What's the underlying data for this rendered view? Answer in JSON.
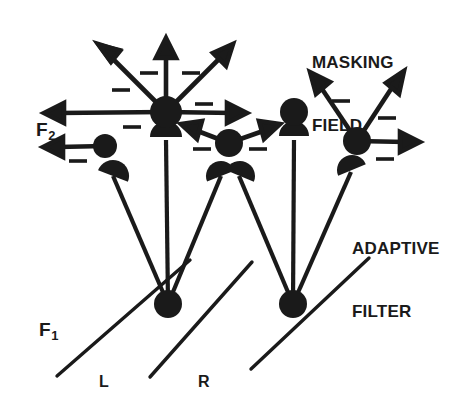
{
  "figure": {
    "background_color": "#ffffff",
    "ink_color": "#1a1a1a",
    "width": 458,
    "height": 410
  },
  "annotations": {
    "masking_field_line1": "MASKING",
    "masking_field_line2": "FIELD",
    "adaptive_filter_line1": "ADAPTIVE",
    "adaptive_filter_line2": "FILTER"
  },
  "layer_labels": {
    "f2_base": "F",
    "f2_sub": "2",
    "f1_base": "F",
    "f1_sub": "1"
  },
  "item_labels": {
    "left": "L",
    "right": "R"
  },
  "diagram_data": {
    "type": "node-link-diagram",
    "f1_nodes": [
      {
        "id": "f1-L",
        "cx": 168,
        "cy": 304,
        "r": 13
      },
      {
        "id": "f1-R",
        "cx": 293,
        "cy": 304,
        "r": 13
      }
    ],
    "f2_nodes": [
      {
        "id": "f2-a",
        "cx": 105,
        "cy": 146,
        "r": 11
      },
      {
        "id": "f2-b",
        "cx": 166,
        "cy": 112,
        "r": 15
      },
      {
        "id": "f2-c",
        "cx": 229,
        "cy": 143,
        "r": 13
      },
      {
        "id": "f2-d",
        "cx": 294,
        "cy": 112,
        "r": 13
      },
      {
        "id": "f2-e",
        "cx": 357,
        "cy": 141,
        "r": 13
      }
    ],
    "inhibitory_arrows": [
      {
        "from": "f2-b",
        "to_x": 100,
        "to_y": 45,
        "sign": "minus"
      },
      {
        "from": "f2-b",
        "to_x": 166,
        "to_y": 40,
        "sign": "minus"
      },
      {
        "from": "f2-b",
        "to_x": 231,
        "to_y": 45,
        "sign": "minus"
      },
      {
        "from": "f2-b",
        "to_x": 47,
        "to_y": 113,
        "sign": "minus"
      },
      {
        "from": "f2-b",
        "to_x": 245,
        "to_y": 113,
        "sign": "minus"
      },
      {
        "from": "f2-a",
        "to_x": 45,
        "to_y": 148,
        "sign": "minus"
      },
      {
        "from": "f2-c",
        "to_x": 183,
        "to_y": 124,
        "sign": "minus"
      },
      {
        "from": "f2-c",
        "to_x": 277,
        "to_y": 124,
        "sign": "minus"
      },
      {
        "from": "f2-e",
        "to_x": 311,
        "to_y": 75,
        "sign": "minus"
      },
      {
        "from": "f2-e",
        "to_x": 402,
        "to_y": 73,
        "sign": "minus"
      },
      {
        "from": "f2-e",
        "to_x": 415,
        "to_y": 145,
        "sign": "minus"
      }
    ],
    "minus_signs": [
      {
        "x": 148,
        "y": 73
      },
      {
        "x": 191,
        "y": 73
      },
      {
        "x": 120,
        "y": 90
      },
      {
        "x": 203,
        "y": 105
      },
      {
        "x": 131,
        "y": 126
      },
      {
        "x": 77,
        "y": 160
      },
      {
        "x": 201,
        "y": 148
      },
      {
        "x": 257,
        "y": 148
      },
      {
        "x": 341,
        "y": 100
      },
      {
        "x": 387,
        "y": 117
      },
      {
        "x": 385,
        "y": 158
      }
    ],
    "adaptive_filter_links": [
      {
        "from": "f1-L",
        "to": "f2-a"
      },
      {
        "from": "f1-L",
        "to": "f2-b"
      },
      {
        "from": "f1-L",
        "to": "f2-c"
      },
      {
        "from": "f1-R",
        "to": "f2-c"
      },
      {
        "from": "f1-R",
        "to": "f2-d"
      },
      {
        "from": "f1-R",
        "to": "f2-e"
      }
    ],
    "baseline_segments": [
      {
        "x1": 57,
        "y1": 376,
        "x2": 190,
        "y2": 260
      },
      {
        "x1": 150,
        "y1": 377,
        "x2": 252,
        "y2": 262
      },
      {
        "x1": 251,
        "y1": 369,
        "x2": 369,
        "y2": 258
      }
    ]
  }
}
